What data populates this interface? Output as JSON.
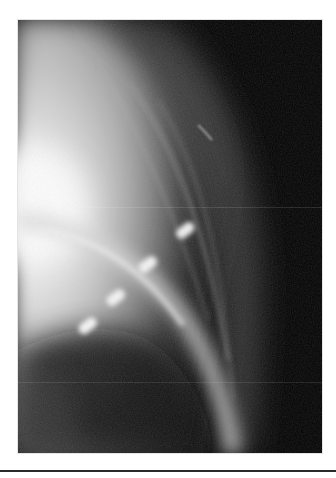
{
  "image": {
    "kind": "grayscale radiograph",
    "colors": {
      "background": "#ffffff",
      "film_dark": "#000000",
      "soft_tissue": "#9a9a9a",
      "bright_region": "#f4f4f4",
      "marker": "#f0f0f0",
      "rule": "#2a2a2a"
    },
    "markers": [
      {
        "cx": 167,
        "cy": 212,
        "label": ""
      },
      {
        "cx": 130,
        "cy": 247,
        "label": ""
      },
      {
        "cx": 98,
        "cy": 280,
        "label": ""
      },
      {
        "cx": 70,
        "cy": 308,
        "label": ""
      }
    ]
  }
}
